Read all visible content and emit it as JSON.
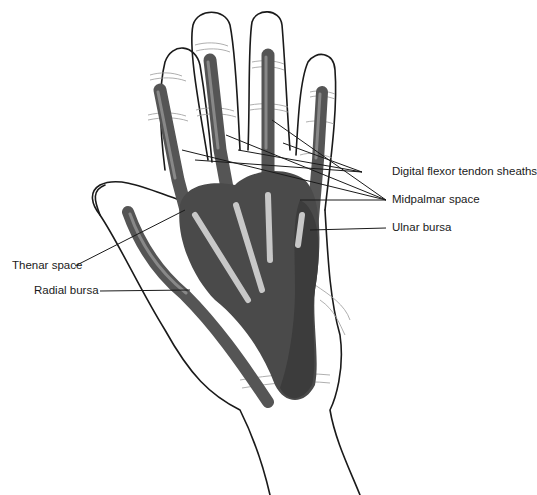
{
  "figure": {
    "colors": {
      "outline": "#1a1a1a",
      "sheath": "#5a5a5a",
      "sheath_dark": "#3c3c3c",
      "space": "#4a4a4a",
      "tendon": "#c8c8c8",
      "leader": "#1a1a1a",
      "background": "#ffffff"
    }
  },
  "labels": {
    "digital_flexor_tendon_sheaths": "Digital flexor tendon sheaths",
    "midpalmar_space": "Midpalmar space",
    "ulnar_bursa": "Ulnar bursa",
    "thenar_space": "Thenar space",
    "radial_bursa": "Radial bursa"
  }
}
